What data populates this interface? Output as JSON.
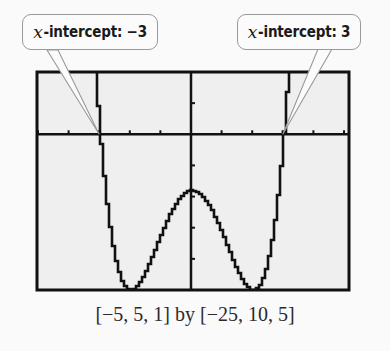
{
  "callouts": [
    {
      "var": "x",
      "text": "-intercept: −3"
    },
    {
      "var": "x",
      "text": "-intercept: 3"
    }
  ],
  "caption": "[−5, 5, 1] by [−25, 10, 5]",
  "colors": {
    "background": "#fafafa",
    "screen": "#efefef",
    "ink": "#111111",
    "callout_border": "#9a9a9a"
  },
  "chart_data": {
    "type": "line",
    "title": "",
    "xlabel": "",
    "ylabel": "",
    "xlim": [
      -5,
      5
    ],
    "ylim": [
      -25,
      10
    ],
    "xscale": 1,
    "yscale": 5,
    "grid": false,
    "function": "y = x^4 - 8x^2 - 9",
    "annotations": [
      {
        "label": "x-intercept: -3",
        "x": -3,
        "y": 0
      },
      {
        "label": "x-intercept: 3",
        "x": 3,
        "y": 0
      }
    ],
    "key_points": {
      "x_intercepts": [
        -3,
        3
      ],
      "local_max": [
        0,
        -9
      ],
      "local_mins": [
        [
          -2,
          -25
        ],
        [
          2,
          -25
        ]
      ]
    },
    "x": [
      -5,
      -4.5,
      -4,
      -3.5,
      -3,
      -2.5,
      -2,
      -1.5,
      -1,
      -0.5,
      0,
      0.5,
      1,
      1.5,
      2,
      2.5,
      3,
      3.5,
      4,
      4.5,
      5
    ],
    "series": [
      {
        "name": "f(x)",
        "values": [
          416,
          239.06,
          119,
          43.06,
          0,
          -19.94,
          -25,
          -22.94,
          -16,
          -10.94,
          -9,
          -10.94,
          -16,
          -22.94,
          -25,
          -19.94,
          0,
          43.06,
          119,
          239.06,
          416
        ]
      }
    ],
    "window_caption": "[-5, 5, 1] by [-25, 10, 5]"
  }
}
